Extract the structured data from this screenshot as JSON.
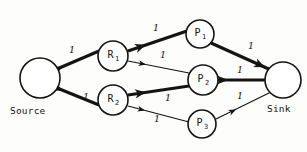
{
  "diagram": {
    "type": "flow-network",
    "width": 307,
    "height": 152,
    "background_color": "#fdfdfb",
    "ink_color": "#141414"
  },
  "nodes": [
    {
      "id": "source",
      "label": "",
      "sub": "",
      "caption": "Source",
      "cx": 40,
      "cy": 78,
      "r": 20
    },
    {
      "id": "r1",
      "label": "R",
      "sub": "1",
      "caption": "",
      "cx": 113,
      "cy": 56,
      "r": 15
    },
    {
      "id": "r2",
      "label": "R",
      "sub": "2",
      "caption": "",
      "cx": 113,
      "cy": 100,
      "r": 15
    },
    {
      "id": "p1",
      "label": "P",
      "sub": "1",
      "caption": "",
      "cx": 200,
      "cy": 34,
      "r": 14
    },
    {
      "id": "p2",
      "label": "P",
      "sub": "2",
      "caption": "",
      "cx": 203,
      "cy": 80,
      "r": 15
    },
    {
      "id": "p3",
      "label": "P",
      "sub": "3",
      "caption": "",
      "cx": 202,
      "cy": 124,
      "r": 14
    },
    {
      "id": "sink",
      "label": "",
      "sub": "",
      "caption": "Sink",
      "cx": 283,
      "cy": 80,
      "r": 18
    }
  ],
  "edges": [
    {
      "id": "source-r1",
      "from": "source",
      "to": "r1",
      "capacity": "1",
      "weight": "thick",
      "x1": 57,
      "y1": 69,
      "x2": 99,
      "y2": 51,
      "label_x": 72,
      "label_y": 53,
      "arrow_x": 63,
      "arrow_y": 66.5,
      "arrow_dir": 335
    },
    {
      "id": "source-r2",
      "from": "source",
      "to": "r2",
      "capacity": "1",
      "weight": "thick",
      "x1": 57,
      "y1": 88,
      "x2": 99,
      "y2": 105,
      "label_x": 86,
      "label_y": 100,
      "arrow_x": 63,
      "arrow_y": 90.5,
      "arrow_dir": 22
    },
    {
      "id": "r1-p1",
      "from": "r1",
      "to": "p1",
      "capacity": "1",
      "weight": "thick",
      "x1": 128,
      "y1": 51,
      "x2": 187,
      "y2": 31,
      "label_x": 156,
      "label_y": 31,
      "arrow_x": 146,
      "arrow_y": 44.8,
      "arrow_dir": 341
    },
    {
      "id": "r1-p2",
      "from": "r1",
      "to": "p2",
      "capacity": "1",
      "weight": "thin",
      "x1": 128,
      "y1": 61,
      "x2": 189,
      "y2": 73,
      "label_x": 163,
      "label_y": 58,
      "arrow_x": 146,
      "arrow_y": 64.6,
      "arrow_dir": 11
    },
    {
      "id": "r2-p2",
      "from": "r2",
      "to": "p2",
      "capacity": "1",
      "weight": "thick",
      "x1": 128,
      "y1": 95,
      "x2": 189,
      "y2": 86,
      "label_x": 168,
      "label_y": 101,
      "arrow_x": 146,
      "arrow_y": 92.3,
      "arrow_dir": 352
    },
    {
      "id": "r2-p3",
      "from": "r2",
      "to": "p3",
      "capacity": "1",
      "weight": "thin",
      "x1": 128,
      "y1": 106,
      "x2": 189,
      "y2": 122,
      "label_x": 157,
      "label_y": 122,
      "arrow_x": 145,
      "arrow_y": 110.5,
      "arrow_dir": 14
    },
    {
      "id": "p1-sink",
      "from": "p1",
      "to": "sink",
      "capacity": "1",
      "weight": "thick",
      "x1": 211,
      "y1": 43,
      "x2": 271,
      "y2": 70,
      "label_x": 251,
      "label_y": 49,
      "arrow_x": 265,
      "arrow_y": 67.3,
      "arrow_dir": 24
    },
    {
      "id": "p2-sink",
      "from": "p2",
      "to": "sink",
      "capacity": "1",
      "weight": "thick",
      "x1": 218,
      "y1": 80,
      "x2": 265,
      "y2": 80,
      "label_x": 240,
      "label_y": 73,
      "arrow_x": 228,
      "arrow_y": 80,
      "arrow_dir": 0
    },
    {
      "id": "p3-sink",
      "from": "p3",
      "to": "sink",
      "capacity": "1",
      "weight": "thin",
      "x1": 216,
      "y1": 119,
      "x2": 271,
      "y2": 92,
      "label_x": 240,
      "label_y": 99,
      "arrow_x": 236,
      "arrow_y": 109.5,
      "arrow_dir": 334
    }
  ],
  "captions": [
    {
      "id": "source-caption",
      "text": "Source",
      "x": 10,
      "y": 114
    },
    {
      "id": "sink-caption",
      "text": "Sink",
      "x": 267,
      "y": 112
    }
  ]
}
